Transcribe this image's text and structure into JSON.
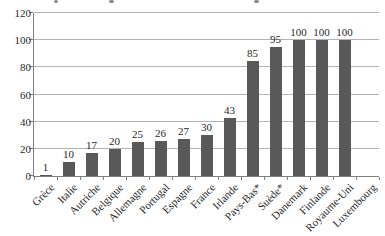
{
  "chart_data": {
    "type": "bar",
    "title": "",
    "xlabel": "",
    "ylabel": "",
    "categories": [
      "Grèce",
      "Italie",
      "Autriche",
      "Belgique",
      "Allemagne",
      "Portugal",
      "Espagne",
      "France",
      "Irlande",
      "Pays-Bas*",
      "Suède*",
      "Danemark",
      "Finlande",
      "Royaume-Uni",
      "Luxembourg"
    ],
    "values": [
      1,
      10,
      17,
      20,
      25,
      26,
      27,
      30,
      43,
      85,
      95,
      100,
      100,
      100,
      0
    ],
    "data_labels": [
      "1",
      "10",
      "17",
      "20",
      "25",
      "26",
      "27",
      "30",
      "43",
      "85",
      "95",
      "100",
      "100",
      "100",
      ""
    ],
    "ylim": [
      0,
      120
    ],
    "yticks": [
      0,
      20,
      40,
      60,
      80,
      100,
      120
    ],
    "grid": true,
    "legend": "none",
    "bar_color": "#595959",
    "gridline_color": "#b3b3b3",
    "axis_color": "#7f7f7f",
    "text_color": "#1f1f1f",
    "note": "title cropped out of frame; only letter descenders visible at top edge"
  }
}
